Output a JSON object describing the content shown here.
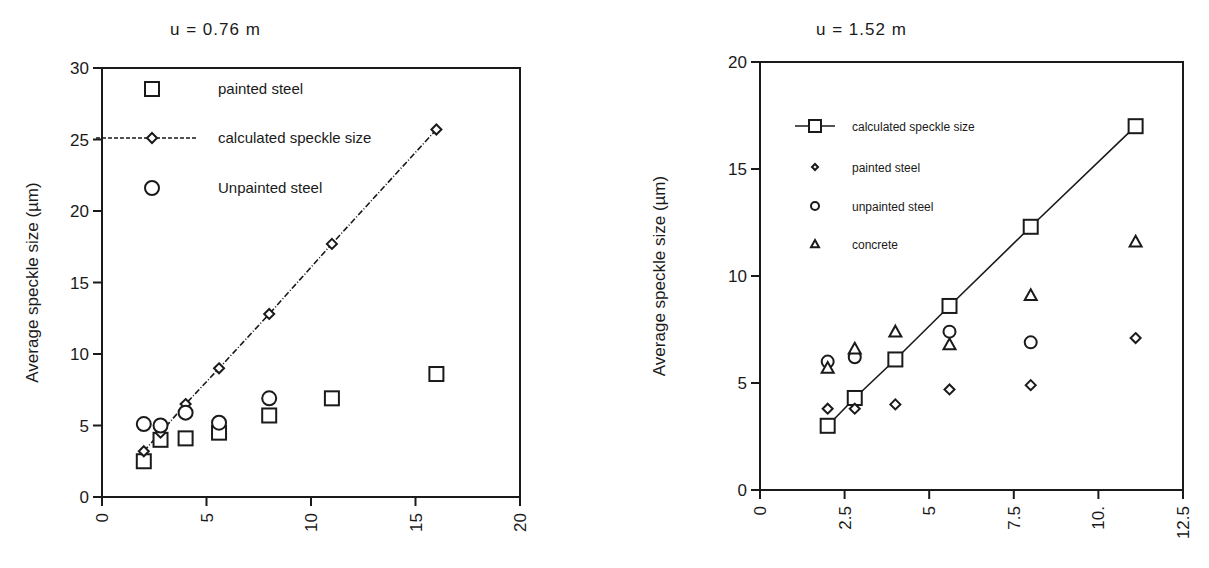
{
  "chart_data": [
    {
      "type": "scatter",
      "title": "u = 0.76 m",
      "xlabel": "",
      "ylabel": "Average speckle size (µm)",
      "xlim": [
        0,
        20
      ],
      "ylim": [
        0,
        30
      ],
      "xticks": [
        "0",
        "5",
        "10",
        "15",
        "20"
      ],
      "yticks": [
        "0",
        "5",
        "10",
        "15",
        "20",
        "25",
        "30"
      ],
      "grid": false,
      "legend_position": "upper-left inside",
      "series": [
        {
          "name": "painted steel",
          "marker": "square",
          "line": false,
          "x": [
            2,
            2.8,
            4,
            5.6,
            8,
            11,
            16
          ],
          "y": [
            2.5,
            4.0,
            4.1,
            4.5,
            5.7,
            6.9,
            8.6
          ]
        },
        {
          "name": "calculated speckle size",
          "marker": "diamond",
          "line": "dash-dot",
          "x": [
            2,
            2.8,
            4,
            5.6,
            8,
            11,
            16
          ],
          "y": [
            3.2,
            4.5,
            6.5,
            9.0,
            12.8,
            17.7,
            25.7
          ]
        },
        {
          "name": "Unpainted steel",
          "marker": "circle",
          "line": false,
          "x": [
            2,
            2.8,
            4,
            5.6,
            8
          ],
          "y": [
            5.1,
            5.0,
            5.9,
            5.2,
            6.9
          ]
        }
      ]
    },
    {
      "type": "scatter",
      "title": "u = 1.52 m",
      "xlabel": "",
      "ylabel": "Average speckle size (µm)",
      "xlim": [
        0,
        12.5
      ],
      "ylim": [
        0,
        20
      ],
      "xticks": [
        "0",
        "2.5",
        "5",
        "7.5",
        "10.",
        "12.5"
      ],
      "yticks": [
        "0",
        "5",
        "10",
        "15",
        "20"
      ],
      "grid": false,
      "legend_position": "upper-left inside",
      "series": [
        {
          "name": "calculated speckle size",
          "marker": "square",
          "line": "solid",
          "x": [
            2,
            2.8,
            4,
            5.6,
            8,
            11.1
          ],
          "y": [
            3.0,
            4.3,
            6.1,
            8.6,
            12.3,
            17.0
          ]
        },
        {
          "name": "painted steel",
          "marker": "diamond",
          "line": false,
          "x": [
            2,
            2.8,
            4,
            5.6,
            8,
            11.1
          ],
          "y": [
            3.8,
            3.8,
            4.0,
            4.7,
            4.9,
            7.1
          ]
        },
        {
          "name": "unpainted steel",
          "marker": "circle",
          "line": false,
          "x": [
            2,
            2.8,
            5.6,
            8
          ],
          "y": [
            6.0,
            6.2,
            7.4,
            6.9
          ]
        },
        {
          "name": "concrete",
          "marker": "triangle",
          "line": false,
          "x": [
            2,
            2.8,
            4,
            5.6,
            8,
            11.1
          ],
          "y": [
            5.7,
            6.6,
            7.4,
            6.8,
            9.1,
            11.6
          ]
        }
      ]
    }
  ],
  "left": {
    "title": "u = 0.76 m",
    "ylabel": "Average speckle size (µm)",
    "legend": [
      "painted steel",
      "calculated speckle size",
      "Unpainted steel"
    ]
  },
  "right": {
    "title": "u = 1.52 m",
    "ylabel": "Average speckle size (µm)",
    "legend": [
      "calculated speckle size",
      "painted steel",
      "unpainted steel",
      "concrete"
    ]
  }
}
